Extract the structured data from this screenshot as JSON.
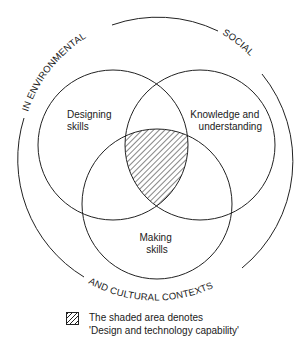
{
  "diagram": {
    "type": "venn",
    "circles": [
      {
        "id": "designing",
        "label_lines": [
          "Designing",
          "skills"
        ]
      },
      {
        "id": "knowledge",
        "label_lines": [
          "Knowledge and",
          "understanding"
        ]
      },
      {
        "id": "making",
        "label_lines": [
          "Making",
          "skills"
        ]
      }
    ],
    "outer_ring_labels": {
      "top_left": "IN ENVIRONMENTAL",
      "top_right": "SOCIAL",
      "bottom": "AND CULTURAL CONTEXTS"
    },
    "shaded_region": "intersection of all three circles",
    "colors": {
      "line": "#222222",
      "background": "#ffffff"
    }
  },
  "legend": {
    "line1": "The shaded area denotes",
    "line2": "'Design and technology capability'"
  }
}
